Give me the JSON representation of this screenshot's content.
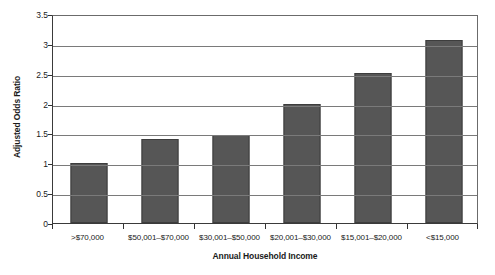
{
  "chart_data": {
    "type": "bar",
    "title": "",
    "xlabel": "Annual Household Income",
    "ylabel": "Adjusted Odds Ratio",
    "categories": [
      ">$70,000",
      "$50,001–$70,000",
      "$30,001–$50,000",
      "$20,001–$30,000",
      "$15,001–$20,000",
      "<$15,000"
    ],
    "values": [
      1.0,
      1.4,
      1.47,
      2.0,
      2.51,
      3.07
    ],
    "ylim": [
      0,
      3.5
    ],
    "yticks": [
      0,
      0.5,
      1,
      1.5,
      2,
      2.5,
      3,
      3.5
    ],
    "ytick_labels": [
      "0",
      "0.5",
      "1",
      "1.5",
      "2",
      "2.5",
      "3",
      "3.5"
    ],
    "grid": true,
    "legend": false,
    "bar_color": "#565656",
    "gridline_color": "#7a7a7a",
    "axis_color": "#3a3a3a"
  }
}
